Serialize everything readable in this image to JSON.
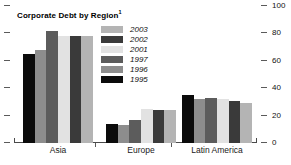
{
  "chart_data": {
    "type": "bar",
    "title": "Corporate Debt by Region",
    "title_superscript": "1",
    "xlabel": "",
    "ylabel": "",
    "categories": [
      "Asia",
      "Europe",
      "Latin America"
    ],
    "ylim": [
      0,
      100
    ],
    "yticks": [
      0,
      20,
      40,
      60,
      80,
      100
    ],
    "ytick_labels": [
      "0",
      "20",
      "40",
      "60",
      "80",
      "100"
    ],
    "grid": false,
    "legend_position": "inside-top-center",
    "axis_side": "both",
    "series": [
      {
        "name": "1995",
        "color": "#0b0b0b",
        "values": [
          65,
          14,
          35
        ]
      },
      {
        "name": "1996",
        "color": "#8d8d8d",
        "values": [
          68,
          13,
          32
        ]
      },
      {
        "name": "1997",
        "color": "#5c5c5c",
        "values": [
          82,
          17,
          33
        ]
      },
      {
        "name": "2001",
        "color": "#e2e2e2",
        "values": [
          78,
          25,
          32
        ]
      },
      {
        "name": "2002",
        "color": "#3a3a3a",
        "values": [
          78,
          24,
          31
        ]
      },
      {
        "name": "2003",
        "color": "#b4b4b4",
        "values": [
          78,
          24,
          29
        ]
      }
    ],
    "legend_order": [
      "2003",
      "2002",
      "2001",
      "1997",
      "1996",
      "1995"
    ]
  },
  "legend": {
    "entries": [
      {
        "label": "2003",
        "color": "#b4b4b4"
      },
      {
        "label": "2002",
        "color": "#3a3a3a"
      },
      {
        "label": "2001",
        "color": "#e2e2e2"
      },
      {
        "label": "1997",
        "color": "#5c5c5c"
      },
      {
        "label": "1996",
        "color": "#8d8d8d"
      },
      {
        "label": "1995",
        "color": "#0b0b0b"
      }
    ]
  },
  "axis": {
    "right_labels": [
      "100",
      "80",
      "60",
      "40",
      "20",
      "0"
    ]
  },
  "colors": {
    "axis": "#4a4a4a",
    "text": "#111111",
    "background": "#ffffff"
  }
}
